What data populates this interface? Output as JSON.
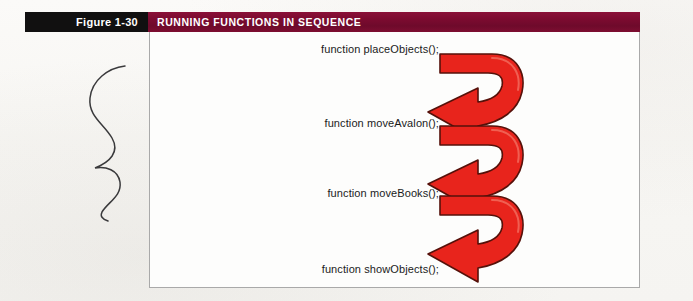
{
  "figure": {
    "label": "Figure 1-30",
    "banner_title": "RUNNING FUNCTIONS IN SEQUENCE"
  },
  "colors": {
    "label_background": "#111010",
    "banner_background": "#7c0b30",
    "banner_text": "#ffffff",
    "arrow_fill": "#e8241c",
    "arrow_outline": "#5a1008",
    "page_background": "#faf9f7",
    "frame_border": "#a9a9a9",
    "code_text": "#1b1b1b"
  },
  "content": {
    "code_lines": [
      "function placeObjects();",
      "function moveAvalon();",
      "function moveBooks();",
      "function showObjects();"
    ],
    "arrows": [
      {
        "name": "sequence-arrow-1",
        "from": "function placeObjects();",
        "to": "function moveAvalon();"
      },
      {
        "name": "sequence-arrow-2",
        "from": "function moveAvalon();",
        "to": "function moveBooks();"
      },
      {
        "name": "sequence-arrow-3",
        "from": "function moveBooks();",
        "to": "function showObjects();"
      }
    ],
    "annotation": "hand-drawn squiggle mark"
  }
}
